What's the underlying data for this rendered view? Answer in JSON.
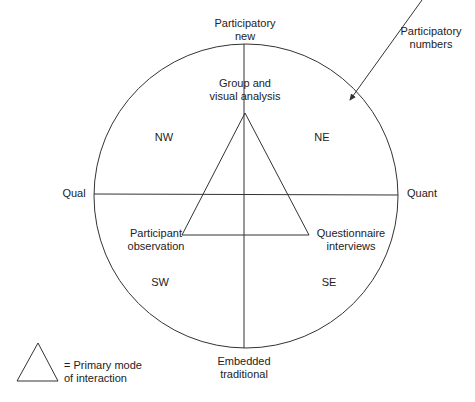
{
  "axes": {
    "top": [
      "Participatory",
      "new"
    ],
    "bottom": [
      "Embedded",
      "traditional"
    ],
    "left": "Qual",
    "right": "Quant"
  },
  "quadrants": {
    "nw": "NW",
    "ne": "NE",
    "sw": "SW",
    "se": "SE"
  },
  "triangle_vertices": {
    "top": [
      "Group and",
      "visual analysis"
    ],
    "bottom_left": [
      "Participant",
      "observation"
    ],
    "bottom_right": [
      "Questionnaire",
      "interviews"
    ]
  },
  "annotation": [
    "Participatory",
    "numbers"
  ],
  "legend": [
    "= Primary mode",
    "of interaction"
  ],
  "colors": {
    "line": "#333333",
    "text": "#222222",
    "background": "#ffffff"
  }
}
